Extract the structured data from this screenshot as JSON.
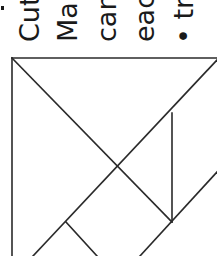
{
  "text": {
    "lines": [
      {
        "label": "Cut"
      },
      {
        "label": "Ma"
      },
      {
        "label": "can"
      },
      {
        "label": "eac"
      },
      {
        "label": "• tr"
      }
    ]
  },
  "diagram": {
    "type": "tangram",
    "stroke_color": "#2a2a2a",
    "segments": [
      {
        "name": "square-top-edge",
        "x1": 12,
        "y1": 58,
        "x2": 217,
        "y2": 58
      },
      {
        "name": "square-left-edge",
        "x1": 12,
        "y1": 58,
        "x2": 12,
        "y2": 256
      },
      {
        "name": "main-diagonal",
        "x1": 12,
        "y1": 58,
        "x2": 172,
        "y2": 222
      },
      {
        "name": "anti-diagonal",
        "x1": 217,
        "y1": 60,
        "x2": 33,
        "y2": 256
      },
      {
        "name": "vertical-cut",
        "x1": 172,
        "y1": 113,
        "x2": 172,
        "y2": 222
      },
      {
        "name": "lower-right-diagonal",
        "x1": 217,
        "y1": 172,
        "x2": 140,
        "y2": 256
      },
      {
        "name": "small-perpendicular",
        "x1": 66,
        "y1": 222,
        "x2": 97,
        "y2": 256
      }
    ]
  }
}
